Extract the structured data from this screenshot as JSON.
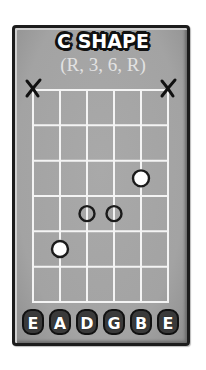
{
  "diagram": {
    "title": "C SHAPE",
    "subtitle": "(R, 3, 6, R)",
    "strings": [
      "E",
      "A",
      "D",
      "G",
      "B",
      "E"
    ],
    "fret_count": 6,
    "muted_strings": [
      1,
      6
    ],
    "muted_symbol": "X",
    "dots": [
      {
        "string": 2,
        "fret": 5,
        "style": "filled-white",
        "meaning": "root"
      },
      {
        "string": 3,
        "fret": 4,
        "style": "hollow"
      },
      {
        "string": 4,
        "fret": 4,
        "style": "hollow"
      },
      {
        "string": 5,
        "fret": 3,
        "style": "filled-white"
      }
    ],
    "colors": {
      "card_background": "#a6a6a6",
      "card_border": "#1c1c1c",
      "grid_lines": "#f4f4f4",
      "subtitle_text": "#e2e2e2",
      "dot_fill": "#ffffff",
      "dot_outline": "#1a1a1a",
      "mute_mark": "#111111"
    }
  }
}
